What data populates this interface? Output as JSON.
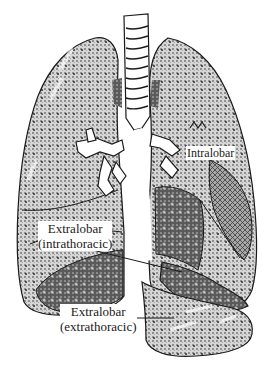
{
  "figure": {
    "colors": {
      "outline": "#1a1a1a",
      "lung_fill_light": "#c8c8c8",
      "lung_fill_dark": "#6e6e6e",
      "background": "#ffffff"
    }
  },
  "labels": {
    "intralobar": "Intralobar",
    "extralobar_intra_line1": "Extralobar",
    "extralobar_intra_line2": "(intrathoracic)",
    "extralobar_extra_line1": "Extralobar",
    "extralobar_extra_line2": "(extrathoracic)"
  },
  "structures": [
    {
      "name": "trachea"
    },
    {
      "name": "right-lung"
    },
    {
      "name": "left-lung"
    },
    {
      "name": "bronchi"
    },
    {
      "name": "intralobar-sequestration"
    },
    {
      "name": "extralobar-intrathoracic-sequestration"
    },
    {
      "name": "extralobar-extrathoracic-sequestration"
    }
  ]
}
